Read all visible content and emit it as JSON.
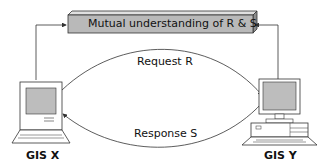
{
  "diagram": {
    "shared_box": {
      "label": "Mutual understanding of R & S",
      "fill": "#b9b9b9"
    },
    "request_label": "Request R",
    "response_label": "Response S",
    "node_x": {
      "label": "GIS X",
      "type": "laptop"
    },
    "node_y": {
      "label": "GIS Y",
      "type": "desktop"
    },
    "colors": {
      "line": "#333333",
      "screen": "#bdbdbd"
    }
  }
}
